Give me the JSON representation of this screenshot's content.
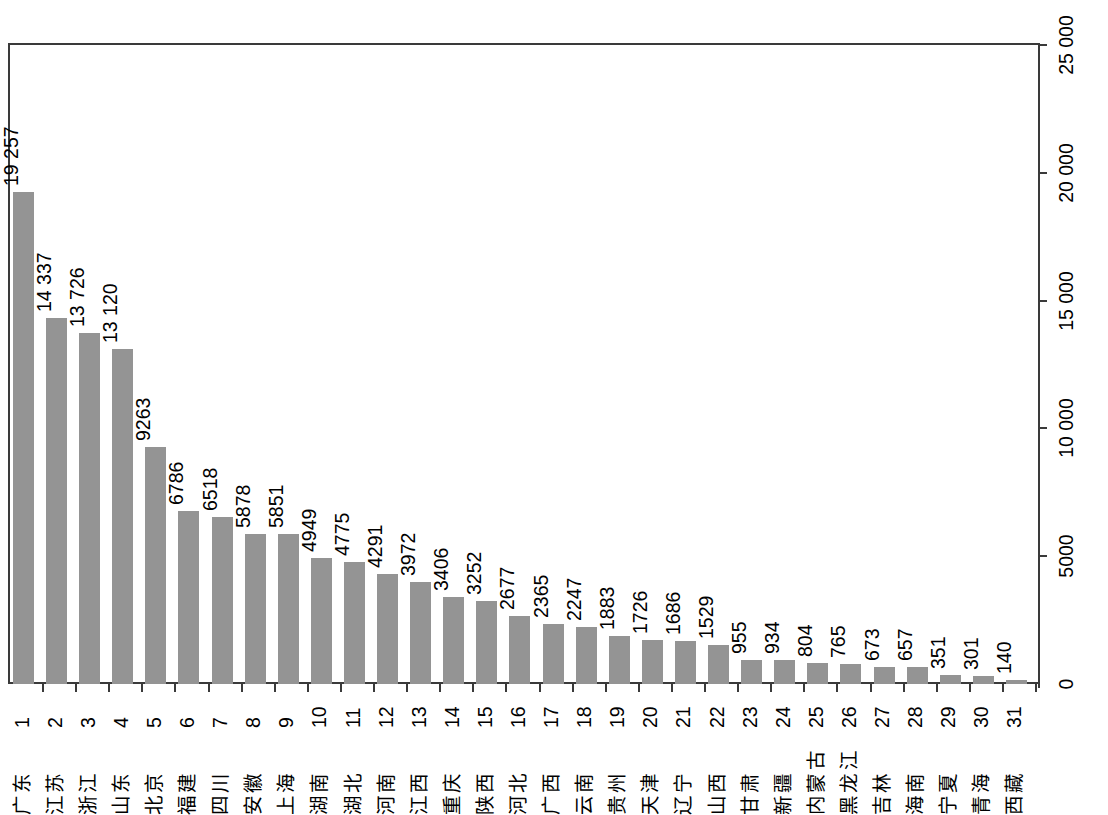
{
  "chart_data": {
    "type": "bar",
    "title": "",
    "subtitle": "",
    "xlabel": "",
    "ylabel": "",
    "orientation": "vertical",
    "grid": false,
    "legend": null,
    "bar_color": "#949494",
    "axis_color": "#3a3a3a",
    "value_labels_shown": true,
    "y_axis_position": "right",
    "ylim": [
      0,
      25000
    ],
    "yticks": [
      0,
      5000,
      10000,
      15000,
      20000,
      25000
    ],
    "ytick_labels": [
      "0",
      "5000",
      "10 000",
      "15 000",
      "20 000",
      "25 000"
    ],
    "ranks": [
      "1",
      "2",
      "3",
      "4",
      "5",
      "6",
      "7",
      "8",
      "9",
      "10",
      "11",
      "12",
      "13",
      "14",
      "15",
      "16",
      "17",
      "18",
      "19",
      "20",
      "21",
      "22",
      "23",
      "24",
      "25",
      "26",
      "27",
      "28",
      "29",
      "30",
      "31"
    ],
    "categories": [
      "广东",
      "江苏",
      "浙江",
      "山东",
      "北京",
      "福建",
      "四川",
      "安徽",
      "上海",
      "湖南",
      "湖北",
      "河南",
      "江西",
      "重庆",
      "陕西",
      "河北",
      "广西",
      "云南",
      "贵州",
      "天津",
      "辽宁",
      "山西",
      "甘肃",
      "新疆",
      "内蒙古",
      "黑龙江",
      "吉林",
      "海南",
      "宁夏",
      "青海",
      "西藏"
    ],
    "values": [
      19257,
      14337,
      13726,
      13120,
      9263,
      6786,
      6518,
      5878,
      5851,
      4949,
      4775,
      4291,
      3972,
      3406,
      3252,
      2677,
      2365,
      2247,
      1883,
      1726,
      1686,
      1529,
      955,
      934,
      804,
      765,
      673,
      657,
      351,
      301,
      140
    ],
    "value_labels": [
      "19 257",
      "14 337",
      "13 726",
      "13 120",
      "9263",
      "6786",
      "6518",
      "5878",
      "5851",
      "4949",
      "4775",
      "4291",
      "3972",
      "3406",
      "3252",
      "2677",
      "2365",
      "2247",
      "1883",
      "1726",
      "1686",
      "1529",
      "955",
      "934",
      "804",
      "765",
      "673",
      "657",
      "351",
      "301",
      "140"
    ]
  }
}
